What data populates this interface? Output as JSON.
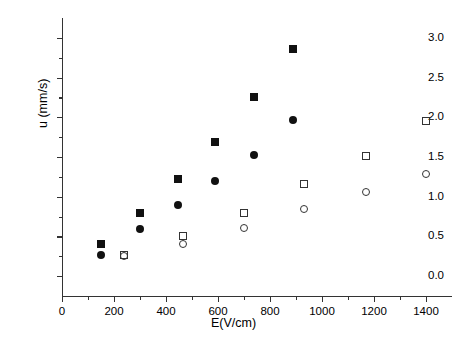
{
  "chart_data": {
    "type": "scatter",
    "title": "",
    "xlabel": "E(V/cm)",
    "ylabel": "u (mm/s)",
    "xlim": [
      0,
      1500
    ],
    "ylim": [
      -0.25,
      3.25
    ],
    "grid": false,
    "legend": "none",
    "xticks": [
      0,
      200,
      400,
      600,
      800,
      1000,
      1200,
      1400
    ],
    "xtick_labels": [
      "0",
      "200",
      "400",
      "600",
      "800",
      "1000",
      "1200",
      "1400"
    ],
    "xminor_ticks": [
      100,
      300,
      500,
      700,
      900,
      1100,
      1300
    ],
    "yticks": [
      0.0,
      0.5,
      1.0,
      1.5,
      2.0,
      2.5,
      3.0
    ],
    "ytick_labels": [
      "0.0",
      "0.5",
      "1.0",
      "1.5",
      "2.0",
      "2.5",
      "3.0"
    ],
    "yminor_ticks": [
      0.25,
      0.75,
      1.25,
      1.75,
      2.25,
      2.75
    ],
    "series": [
      {
        "name": "filled-square",
        "marker": "filled-square",
        "color": "#111111",
        "points": [
          {
            "x": 150,
            "y": 0.4
          },
          {
            "x": 300,
            "y": 0.79
          },
          {
            "x": 448,
            "y": 1.22
          },
          {
            "x": 590,
            "y": 1.69
          },
          {
            "x": 740,
            "y": 2.26
          },
          {
            "x": 890,
            "y": 2.86
          }
        ]
      },
      {
        "name": "filled-circle",
        "marker": "filled-circle",
        "color": "#111111",
        "points": [
          {
            "x": 150,
            "y": 0.27
          },
          {
            "x": 300,
            "y": 0.59
          },
          {
            "x": 448,
            "y": 0.9
          },
          {
            "x": 590,
            "y": 1.2
          },
          {
            "x": 740,
            "y": 1.53
          },
          {
            "x": 890,
            "y": 1.96
          }
        ]
      },
      {
        "name": "open-square",
        "marker": "open-square",
        "color": "#333333",
        "points": [
          {
            "x": 238,
            "y": 0.26
          },
          {
            "x": 466,
            "y": 0.51
          },
          {
            "x": 700,
            "y": 0.79
          },
          {
            "x": 932,
            "y": 1.16
          },
          {
            "x": 1168,
            "y": 1.51
          },
          {
            "x": 1400,
            "y": 1.95
          }
        ]
      },
      {
        "name": "open-circle",
        "marker": "open-circle",
        "color": "#333333",
        "points": [
          {
            "x": 238,
            "y": 0.25
          },
          {
            "x": 466,
            "y": 0.4
          },
          {
            "x": 700,
            "y": 0.61
          },
          {
            "x": 932,
            "y": 0.84
          },
          {
            "x": 1168,
            "y": 1.06
          },
          {
            "x": 1400,
            "y": 1.29
          }
        ]
      }
    ]
  }
}
